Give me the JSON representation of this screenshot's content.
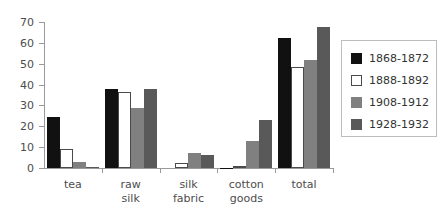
{
  "chart_data": {
    "type": "bar",
    "title": "",
    "subtitle": "",
    "xlabel": "",
    "ylabel": "",
    "ylim": [
      0,
      70
    ],
    "yticks": [
      0,
      10,
      20,
      30,
      40,
      50,
      60,
      70
    ],
    "ytick_labels": [
      "0",
      "10",
      "20",
      "30",
      "40",
      "50",
      "60",
      "70"
    ],
    "grid": false,
    "legend_position": "right",
    "categories": [
      "tea",
      "raw\nsilk",
      "silk\nfabric",
      "cotton\ngoods",
      "total"
    ],
    "series": [
      {
        "name": "1868-1872",
        "color": "#111111",
        "values": [
          24.5,
          37.8,
          0.0,
          0.2,
          62.2
        ]
      },
      {
        "name": "1888-1892",
        "color": "#ffffff",
        "values": [
          9.3,
          36.4,
          2.4,
          0.2,
          48.2
        ]
      },
      {
        "name": "1908-1912",
        "color": "#808080",
        "values": [
          3.0,
          28.8,
          7.1,
          13.0,
          51.8
        ]
      },
      {
        "name": "1928-1932",
        "color": "#595959",
        "values": [
          0.7,
          37.7,
          6.2,
          23.0,
          67.5
        ]
      }
    ]
  },
  "legend": {
    "items": [
      {
        "label": "1868-1872"
      },
      {
        "label": "1888-1892"
      },
      {
        "label": "1908-1912"
      },
      {
        "label": "1928-1932"
      }
    ]
  },
  "colors": {
    "axis": "#9a9a9a",
    "text": "#4d4d4d",
    "legend_border": "#bdbdbd",
    "series_1": "#111111",
    "series_2": "#ffffff",
    "series_3": "#808080",
    "series_4": "#595959"
  }
}
